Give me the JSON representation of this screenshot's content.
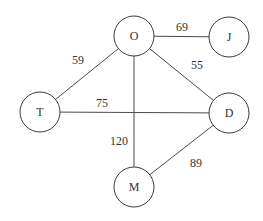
{
  "diagram": {
    "type": "weighted-undirected-graph",
    "nodes": [
      {
        "id": "O",
        "label": "O",
        "x": 134,
        "y": 36
      },
      {
        "id": "J",
        "label": "J",
        "x": 229,
        "y": 37
      },
      {
        "id": "T",
        "label": "T",
        "x": 40,
        "y": 112
      },
      {
        "id": "D",
        "label": "D",
        "x": 229,
        "y": 113
      },
      {
        "id": "M",
        "label": "M",
        "x": 134,
        "y": 187
      }
    ],
    "edges": [
      {
        "from": "O",
        "to": "J",
        "weight": "69",
        "lx": 182,
        "ly": 27
      },
      {
        "from": "O",
        "to": "T",
        "weight": "59",
        "lx": 78,
        "ly": 60
      },
      {
        "from": "O",
        "to": "D",
        "weight": "55",
        "lx": 197,
        "ly": 65
      },
      {
        "from": "T",
        "to": "D",
        "weight": "75",
        "lx": 102,
        "ly": 103
      },
      {
        "from": "O",
        "to": "M",
        "weight": "120",
        "lx": 119,
        "ly": 141
      },
      {
        "from": "D",
        "to": "M",
        "weight": "89",
        "lx": 196,
        "ly": 163
      }
    ],
    "node_radius": 20
  }
}
